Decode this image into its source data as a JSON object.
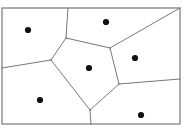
{
  "figure": {
    "type": "voronoi-diagram",
    "background_color": "#ffffff",
    "line_color": "#4a4a4a",
    "border_color": "#6b6b6b",
    "point_color": "#111111",
    "point_radius": 3.1,
    "canvas": {
      "width": 187,
      "height": 131
    }
  },
  "chart_data": {
    "type": "scatter",
    "title": "",
    "xlabel": "",
    "ylabel": "",
    "grid": false,
    "legend": null,
    "xlim": [
      2,
      180
    ],
    "ylim": [
      8,
      124
    ],
    "bounding_box": {
      "x0": 2,
      "y0": 8,
      "x1": 180,
      "y1": 124
    },
    "seed_points": [
      {
        "id": "p1",
        "label": "top-left",
        "x": 28,
        "y": 30
      },
      {
        "id": "p2",
        "label": "top-right",
        "x": 106,
        "y": 22
      },
      {
        "id": "p3",
        "label": "right",
        "x": 135,
        "y": 58
      },
      {
        "id": "p4",
        "label": "center",
        "x": 89,
        "y": 68
      },
      {
        "id": "p5",
        "label": "bottom-left",
        "x": 40,
        "y": 100
      },
      {
        "id": "p6",
        "label": "bottom-right",
        "x": 141,
        "y": 115
      }
    ],
    "vertices": [
      {
        "id": "v-top",
        "x": 66,
        "y": 38
      },
      {
        "id": "v-upper-right",
        "x": 110,
        "y": 48
      },
      {
        "id": "v-lower-right",
        "x": 119,
        "y": 84
      },
      {
        "id": "v-bottom",
        "x": 90,
        "y": 110
      },
      {
        "id": "v-left",
        "x": 51,
        "y": 60
      }
    ],
    "edges": [
      {
        "id": "e-center-top-left",
        "from": [
          66,
          38
        ],
        "to": [
          110,
          48
        ]
      },
      {
        "id": "e-center-right",
        "from": [
          110,
          48
        ],
        "to": [
          119,
          84
        ]
      },
      {
        "id": "e-center-bottom-right",
        "from": [
          119,
          84
        ],
        "to": [
          90,
          110
        ]
      },
      {
        "id": "e-center-bottom-left",
        "from": [
          90,
          110
        ],
        "to": [
          51,
          60
        ]
      },
      {
        "id": "e-center-upper-left",
        "from": [
          51,
          60
        ],
        "to": [
          66,
          38
        ]
      },
      {
        "id": "e-top-boundary",
        "from": [
          66,
          38
        ],
        "to": [
          68,
          8
        ]
      },
      {
        "id": "e-left-boundary",
        "from": [
          51,
          60
        ],
        "to": [
          2,
          68
        ]
      },
      {
        "id": "e-upper-right-boundary",
        "from": [
          110,
          48
        ],
        "to": [
          180,
          8
        ]
      },
      {
        "id": "e-right-boundary",
        "from": [
          119,
          84
        ],
        "to": [
          180,
          79
        ]
      },
      {
        "id": "e-bottom-boundary",
        "from": [
          90,
          110
        ],
        "to": [
          91,
          124
        ]
      }
    ],
    "cells": [
      {
        "id": "cell-center",
        "seed": "p4",
        "polygon": [
          [
            66,
            38
          ],
          [
            110,
            48
          ],
          [
            119,
            84
          ],
          [
            90,
            110
          ],
          [
            51,
            60
          ]
        ]
      },
      {
        "id": "cell-top-left",
        "seed": "p1",
        "polygon": [
          [
            2,
            8
          ],
          [
            68,
            8
          ],
          [
            66,
            38
          ],
          [
            51,
            60
          ],
          [
            2,
            68
          ]
        ]
      },
      {
        "id": "cell-top-right",
        "seed": "p2",
        "polygon": [
          [
            68,
            8
          ],
          [
            180,
            8
          ],
          [
            110,
            48
          ],
          [
            66,
            38
          ]
        ]
      },
      {
        "id": "cell-right",
        "seed": "p3",
        "polygon": [
          [
            180,
            8
          ],
          [
            180,
            79
          ],
          [
            119,
            84
          ],
          [
            110,
            48
          ]
        ]
      },
      {
        "id": "cell-bottom-left",
        "seed": "p5",
        "polygon": [
          [
            2,
            68
          ],
          [
            51,
            60
          ],
          [
            90,
            110
          ],
          [
            91,
            124
          ],
          [
            2,
            124
          ]
        ]
      },
      {
        "id": "cell-bottom-right",
        "seed": "p6",
        "polygon": [
          [
            91,
            124
          ],
          [
            90,
            110
          ],
          [
            119,
            84
          ],
          [
            180,
            79
          ],
          [
            180,
            124
          ]
        ]
      }
    ]
  }
}
